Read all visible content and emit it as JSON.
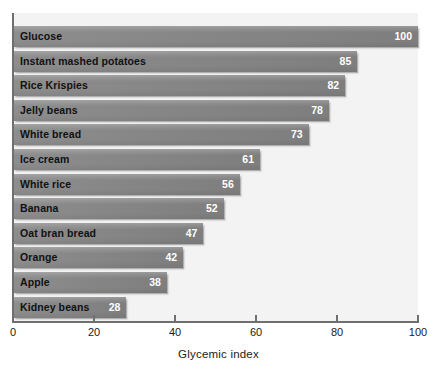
{
  "chart_data": {
    "type": "bar",
    "orientation": "horizontal",
    "title": "",
    "xlabel": "Glycemic index",
    "ylabel": "",
    "xlim": [
      0,
      100
    ],
    "xticks": [
      0,
      20,
      40,
      60,
      80,
      100
    ],
    "grid": false,
    "legend": null,
    "categories": [
      "Glucose",
      "Instant mashed potatoes",
      "Rice Krispies",
      "Jelly beans",
      "White bread",
      "Ice cream",
      "White rice",
      "Banana",
      "Oat bran bread",
      "Orange",
      "Apple",
      "Kidney beans"
    ],
    "values": [
      100,
      85,
      82,
      78,
      73,
      61,
      56,
      52,
      47,
      42,
      38,
      28
    ],
    "value_labels": [
      "100",
      "85",
      "82",
      "78",
      "73",
      "61",
      "56",
      "52",
      "47",
      "42",
      "38",
      "28"
    ],
    "bars": [
      {
        "label": "Glucose",
        "value": 100,
        "value_label": "100"
      },
      {
        "label": "Instant mashed potatoes",
        "value": 85,
        "value_label": "85"
      },
      {
        "label": "Rice Krispies",
        "value": 82,
        "value_label": "82"
      },
      {
        "label": "Jelly beans",
        "value": 78,
        "value_label": "78"
      },
      {
        "label": "White bread",
        "value": 73,
        "value_label": "73"
      },
      {
        "label": "Ice cream",
        "value": 61,
        "value_label": "61"
      },
      {
        "label": "White rice",
        "value": 56,
        "value_label": "56"
      },
      {
        "label": "Banana",
        "value": 52,
        "value_label": "52"
      },
      {
        "label": "Oat bran bread",
        "value": 47,
        "value_label": "47"
      },
      {
        "label": "Orange",
        "value": 42,
        "value_label": "42"
      },
      {
        "label": "Apple",
        "value": 38,
        "value_label": "38"
      },
      {
        "label": "Kidney beans",
        "value": 28,
        "value_label": "28"
      }
    ],
    "tick_labels": [
      "0",
      "20",
      "40",
      "60",
      "80",
      "100"
    ],
    "colors": {
      "bar_fill": "#858585",
      "plot_background": "#f3f3f3",
      "figure_background": "#ffffff",
      "axis_line": "#6f6f6f",
      "label_text": "#111111",
      "value_text": "#ffffff",
      "tick_text": "#1a1a1a"
    }
  }
}
